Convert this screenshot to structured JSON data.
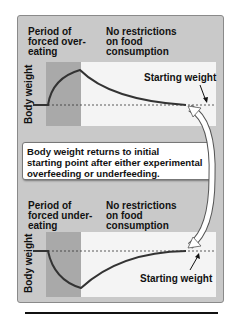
{
  "top_panel": {
    "phase1_label": [
      "Period of",
      "forced over-",
      "eating"
    ],
    "phase2_label": [
      "No restrictions",
      "on food",
      "consumption"
    ],
    "y_axis_label": "Body weight",
    "annotation": "Starting weight"
  },
  "callout": {
    "lines": [
      "Body weight returns to initial",
      "starting point after either experimental",
      "overfeeding or underfeeding."
    ]
  },
  "bottom_panel": {
    "phase1_label": [
      "Period of",
      "forced under-",
      "eating"
    ],
    "phase2_label": [
      "No restrictions",
      "on food",
      "consumption"
    ],
    "y_axis_label": "Body weight",
    "annotation": "Starting weight"
  },
  "colors": {
    "panel": "#c9c9c9",
    "shaded_region": "#a9a9a9",
    "unrestricted_region": "#f4f4f4",
    "curve": "#333333"
  }
}
